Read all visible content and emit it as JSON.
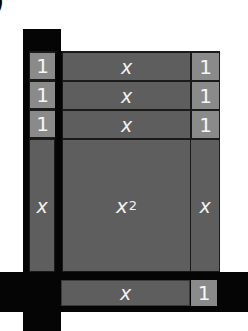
{
  "figure": {
    "label_fragment": ")",
    "colors": {
      "background": "#ffffff",
      "bar": "#050505",
      "x_tile": "#5e5e5e",
      "unit_tile": "#8a8a8a",
      "text": "#f2f2f2"
    },
    "top_rows": [
      {
        "left": "1",
        "middle": "x",
        "right": "1"
      },
      {
        "left": "1",
        "middle": "x",
        "right": "1"
      },
      {
        "left": "1",
        "middle": "x",
        "right": "1"
      }
    ],
    "middle_row": {
      "left": "x",
      "center": "x",
      "center_exp": "2",
      "right": "x"
    },
    "bottom_row": {
      "middle": "x",
      "right": "1"
    }
  }
}
